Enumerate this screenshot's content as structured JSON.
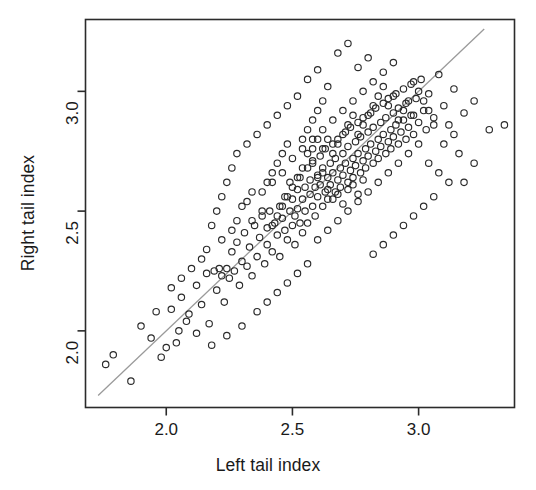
{
  "chart_data": {
    "type": "scatter",
    "title": "",
    "xlabel": "Left tail index",
    "ylabel": "Right tail index",
    "xlim": [
      1.68,
      3.38
    ],
    "ylim": [
      1.68,
      3.3
    ],
    "xticks": [
      2.0,
      2.5,
      3.0
    ],
    "xticklabels": [
      "2.0",
      "2.5",
      "3.0"
    ],
    "yticks": [
      2.0,
      2.5,
      3.0
    ],
    "yticklabels": [
      "2.0",
      "2.5",
      "3.0"
    ],
    "grid": false,
    "legend": null,
    "marker": "open-circle",
    "marker_color": "#2b2b2b",
    "reference_line": {
      "kind": "identity",
      "label": "y = x",
      "color": "#9a9a9a",
      "from": [
        1.73,
        1.73
      ],
      "to": [
        3.26,
        3.26
      ]
    },
    "n_points": 299,
    "points": [
      [
        1.76,
        1.86
      ],
      [
        1.79,
        1.9
      ],
      [
        1.86,
        1.79
      ],
      [
        1.9,
        2.02
      ],
      [
        1.94,
        1.97
      ],
      [
        1.96,
        2.08
      ],
      [
        2.0,
        1.93
      ],
      [
        2.02,
        2.09
      ],
      [
        2.05,
        2.0
      ],
      [
        2.06,
        2.14
      ],
      [
        2.09,
        2.07
      ],
      [
        2.12,
        2.19
      ],
      [
        2.14,
        2.11
      ],
      [
        2.16,
        2.24
      ],
      [
        2.17,
        2.03
      ],
      [
        2.19,
        2.25
      ],
      [
        2.2,
        2.17
      ],
      [
        2.21,
        2.26
      ],
      [
        2.22,
        2.23
      ],
      [
        2.23,
        2.12
      ],
      [
        2.24,
        2.26
      ],
      [
        2.25,
        2.22
      ],
      [
        2.26,
        2.33
      ],
      [
        2.27,
        2.25
      ],
      [
        2.28,
        2.37
      ],
      [
        2.29,
        2.19
      ],
      [
        2.3,
        2.29
      ],
      [
        2.31,
        2.41
      ],
      [
        2.32,
        2.27
      ],
      [
        2.33,
        2.35
      ],
      [
        2.34,
        2.23
      ],
      [
        2.35,
        2.44
      ],
      [
        2.36,
        2.31
      ],
      [
        2.37,
        2.39
      ],
      [
        2.38,
        2.48
      ],
      [
        2.39,
        2.28
      ],
      [
        2.4,
        2.43
      ],
      [
        2.4,
        2.36
      ],
      [
        2.41,
        2.5
      ],
      [
        2.42,
        2.33
      ],
      [
        2.43,
        2.45
      ],
      [
        2.44,
        2.4
      ],
      [
        2.45,
        2.52
      ],
      [
        2.45,
        2.31
      ],
      [
        2.46,
        2.47
      ],
      [
        2.47,
        2.42
      ],
      [
        2.47,
        2.56
      ],
      [
        2.48,
        2.38
      ],
      [
        2.49,
        2.5
      ],
      [
        2.49,
        2.62
      ],
      [
        2.5,
        2.44
      ],
      [
        2.5,
        2.55
      ],
      [
        2.51,
        2.48
      ],
      [
        2.51,
        2.36
      ],
      [
        2.52,
        2.59
      ],
      [
        2.52,
        2.51
      ],
      [
        2.53,
        2.45
      ],
      [
        2.53,
        2.64
      ],
      [
        2.54,
        2.55
      ],
      [
        2.54,
        2.41
      ],
      [
        2.55,
        2.6
      ],
      [
        2.55,
        2.5
      ],
      [
        2.56,
        2.68
      ],
      [
        2.56,
        2.45
      ],
      [
        2.57,
        2.57
      ],
      [
        2.57,
        2.63
      ],
      [
        2.58,
        2.52
      ],
      [
        2.58,
        2.71
      ],
      [
        2.59,
        2.6
      ],
      [
        2.59,
        2.48
      ],
      [
        2.6,
        2.65
      ],
      [
        2.6,
        2.56
      ],
      [
        2.61,
        2.73
      ],
      [
        2.61,
        2.61
      ],
      [
        2.62,
        2.52
      ],
      [
        2.62,
        2.68
      ],
      [
        2.63,
        2.58
      ],
      [
        2.63,
        2.76
      ],
      [
        2.64,
        2.64
      ],
      [
        2.64,
        2.55
      ],
      [
        2.65,
        2.7
      ],
      [
        2.65,
        2.61
      ],
      [
        2.66,
        2.78
      ],
      [
        2.66,
        2.66
      ],
      [
        2.67,
        2.58
      ],
      [
        2.67,
        2.72
      ],
      [
        2.68,
        2.63
      ],
      [
        2.68,
        2.8
      ],
      [
        2.69,
        2.68
      ],
      [
        2.69,
        2.6
      ],
      [
        2.7,
        2.74
      ],
      [
        2.7,
        2.65
      ],
      [
        2.71,
        2.83
      ],
      [
        2.71,
        2.7
      ],
      [
        2.72,
        2.62
      ],
      [
        2.72,
        2.77
      ],
      [
        2.73,
        2.67
      ],
      [
        2.73,
        2.85
      ],
      [
        2.74,
        2.72
      ],
      [
        2.74,
        2.64
      ],
      [
        2.75,
        2.79
      ],
      [
        2.75,
        2.69
      ],
      [
        2.76,
        2.87
      ],
      [
        2.76,
        2.74
      ],
      [
        2.77,
        2.66
      ],
      [
        2.77,
        2.81
      ],
      [
        2.78,
        2.71
      ],
      [
        2.78,
        2.89
      ],
      [
        2.79,
        2.76
      ],
      [
        2.79,
        2.68
      ],
      [
        2.8,
        2.83
      ],
      [
        2.8,
        2.73
      ],
      [
        2.81,
        2.91
      ],
      [
        2.81,
        2.78
      ],
      [
        2.82,
        2.7
      ],
      [
        2.82,
        2.85
      ],
      [
        2.83,
        2.75
      ],
      [
        2.83,
        2.93
      ],
      [
        2.84,
        2.8
      ],
      [
        2.84,
        2.72
      ],
      [
        2.85,
        2.87
      ],
      [
        2.85,
        2.77
      ],
      [
        2.86,
        2.95
      ],
      [
        2.86,
        2.82
      ],
      [
        2.87,
        2.74
      ],
      [
        2.87,
        2.89
      ],
      [
        2.88,
        2.79
      ],
      [
        2.88,
        2.97
      ],
      [
        2.89,
        2.84
      ],
      [
        2.89,
        2.76
      ],
      [
        2.9,
        2.91
      ],
      [
        2.9,
        2.81
      ],
      [
        2.91,
        2.99
      ],
      [
        2.91,
        2.86
      ],
      [
        2.92,
        2.78
      ],
      [
        2.92,
        2.93
      ],
      [
        2.93,
        2.83
      ],
      [
        2.94,
        3.01
      ],
      [
        2.94,
        2.88
      ],
      [
        2.95,
        2.8
      ],
      [
        2.95,
        2.95
      ],
      [
        2.96,
        2.85
      ],
      [
        2.97,
        3.03
      ],
      [
        2.97,
        2.9
      ],
      [
        2.98,
        2.82
      ],
      [
        2.99,
        2.97
      ],
      [
        3.0,
        2.87
      ],
      [
        3.01,
        3.05
      ],
      [
        3.02,
        2.92
      ],
      [
        3.03,
        2.84
      ],
      [
        3.04,
        2.99
      ],
      [
        3.06,
        2.89
      ],
      [
        3.08,
        3.07
      ],
      [
        3.1,
        2.94
      ],
      [
        3.12,
        2.86
      ],
      [
        3.14,
        3.01
      ],
      [
        3.18,
        2.91
      ],
      [
        3.22,
        2.96
      ],
      [
        3.28,
        2.84
      ],
      [
        3.34,
        2.86
      ],
      [
        2.3,
        2.52
      ],
      [
        2.34,
        2.46
      ],
      [
        2.38,
        2.58
      ],
      [
        2.42,
        2.62
      ],
      [
        2.46,
        2.66
      ],
      [
        2.5,
        2.72
      ],
      [
        2.54,
        2.76
      ],
      [
        2.58,
        2.8
      ],
      [
        2.62,
        2.84
      ],
      [
        2.66,
        2.88
      ],
      [
        2.7,
        2.92
      ],
      [
        2.74,
        2.96
      ],
      [
        2.78,
        3.0
      ],
      [
        2.82,
        3.04
      ],
      [
        2.86,
        3.08
      ],
      [
        2.9,
        3.12
      ],
      [
        2.68,
        3.16
      ],
      [
        2.72,
        3.2
      ],
      [
        2.76,
        3.1
      ],
      [
        2.8,
        3.14
      ],
      [
        2.56,
        3.05
      ],
      [
        2.6,
        3.09
      ],
      [
        2.64,
        3.02
      ],
      [
        2.52,
        2.98
      ],
      [
        2.48,
        2.94
      ],
      [
        2.44,
        2.9
      ],
      [
        2.4,
        2.86
      ],
      [
        2.36,
        2.82
      ],
      [
        2.32,
        2.78
      ],
      [
        2.28,
        2.74
      ],
      [
        2.26,
        2.68
      ],
      [
        2.24,
        2.62
      ],
      [
        2.22,
        2.56
      ],
      [
        2.2,
        2.5
      ],
      [
        2.18,
        2.44
      ],
      [
        2.6,
        2.38
      ],
      [
        2.64,
        2.42
      ],
      [
        2.68,
        2.46
      ],
      [
        2.72,
        2.5
      ],
      [
        2.76,
        2.54
      ],
      [
        2.8,
        2.58
      ],
      [
        2.84,
        2.62
      ],
      [
        2.88,
        2.66
      ],
      [
        2.92,
        2.7
      ],
      [
        2.96,
        2.74
      ],
      [
        3.0,
        2.78
      ],
      [
        3.04,
        2.7
      ],
      [
        3.08,
        2.66
      ],
      [
        3.12,
        2.62
      ],
      [
        3.16,
        2.74
      ],
      [
        2.9,
        2.4
      ],
      [
        2.94,
        2.44
      ],
      [
        2.98,
        2.48
      ],
      [
        3.02,
        2.52
      ],
      [
        3.06,
        2.56
      ],
      [
        2.86,
        2.36
      ],
      [
        2.82,
        2.32
      ],
      [
        2.56,
        2.28
      ],
      [
        2.52,
        2.24
      ],
      [
        2.48,
        2.2
      ],
      [
        2.44,
        2.16
      ],
      [
        2.4,
        2.12
      ],
      [
        2.36,
        2.08
      ],
      [
        2.3,
        2.02
      ],
      [
        2.24,
        1.98
      ],
      [
        2.18,
        1.94
      ],
      [
        2.12,
        1.99
      ],
      [
        2.08,
        2.04
      ],
      [
        2.04,
        1.95
      ],
      [
        1.98,
        1.89
      ],
      [
        2.64,
        2.59
      ],
      [
        2.66,
        2.55
      ],
      [
        2.68,
        2.57
      ],
      [
        2.7,
        2.53
      ],
      [
        2.72,
        2.59
      ],
      [
        2.74,
        2.61
      ],
      [
        2.76,
        2.57
      ],
      [
        2.78,
        2.63
      ],
      [
        2.6,
        2.64
      ],
      [
        2.62,
        2.66
      ],
      [
        2.58,
        2.7
      ],
      [
        2.56,
        2.74
      ],
      [
        2.54,
        2.68
      ],
      [
        2.52,
        2.64
      ],
      [
        2.5,
        2.6
      ],
      [
        2.48,
        2.56
      ],
      [
        2.46,
        2.52
      ],
      [
        2.44,
        2.48
      ],
      [
        2.42,
        2.44
      ],
      [
        2.38,
        2.5
      ],
      [
        2.56,
        2.84
      ],
      [
        2.58,
        2.88
      ],
      [
        2.6,
        2.92
      ],
      [
        2.62,
        2.96
      ],
      [
        2.54,
        2.8
      ],
      [
        2.88,
        2.94
      ],
      [
        2.9,
        2.98
      ],
      [
        2.92,
        2.88
      ],
      [
        2.94,
        2.92
      ],
      [
        2.96,
        2.96
      ],
      [
        2.84,
        2.98
      ],
      [
        2.86,
        3.02
      ],
      [
        2.82,
        2.94
      ],
      [
        2.8,
        2.9
      ],
      [
        2.78,
        2.86
      ],
      [
        2.76,
        2.82
      ],
      [
        2.74,
        2.9
      ],
      [
        2.72,
        2.86
      ],
      [
        2.7,
        2.82
      ],
      [
        2.68,
        2.78
      ],
      [
        2.66,
        2.74
      ],
      [
        2.64,
        2.8
      ],
      [
        2.62,
        2.76
      ],
      [
        2.6,
        2.8
      ],
      [
        2.58,
        2.76
      ],
      [
        3.0,
        3.0
      ],
      [
        2.98,
        3.04
      ],
      [
        3.02,
        2.96
      ],
      [
        3.04,
        2.92
      ],
      [
        2.98,
        2.9
      ],
      [
        2.44,
        2.7
      ],
      [
        2.46,
        2.74
      ],
      [
        2.48,
        2.78
      ],
      [
        2.42,
        2.66
      ],
      [
        2.4,
        2.62
      ],
      [
        2.34,
        2.58
      ],
      [
        2.32,
        2.54
      ],
      [
        2.28,
        2.46
      ],
      [
        2.26,
        2.42
      ],
      [
        2.22,
        2.38
      ],
      [
        2.16,
        2.34
      ],
      [
        2.14,
        2.3
      ],
      [
        2.1,
        2.26
      ],
      [
        2.06,
        2.22
      ],
      [
        2.02,
        2.18
      ],
      [
        3.18,
        2.62
      ],
      [
        3.22,
        2.7
      ],
      [
        3.1,
        2.78
      ],
      [
        3.14,
        2.82
      ],
      [
        3.06,
        2.86
      ]
    ]
  },
  "axis_titles": {
    "x": "Left tail index",
    "y": "Right tail index"
  },
  "ticks": {
    "x": [
      "2.0",
      "2.5",
      "3.0"
    ],
    "y": [
      "2.0",
      "2.5",
      "3.0"
    ]
  },
  "style": {
    "frame_color": "#2b2b2b",
    "text_color": "#1a1a1a",
    "marker_color": "#2b2b2b",
    "line_color": "#9a9a9a",
    "background": "#ffffff"
  }
}
